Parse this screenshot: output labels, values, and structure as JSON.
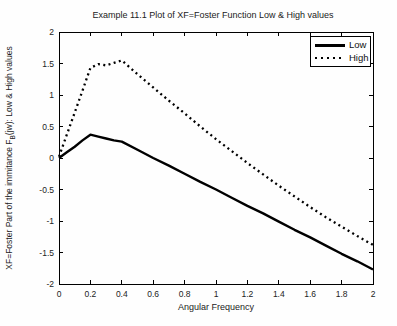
{
  "figure": {
    "background": "#fefefe",
    "line_color": "#000000"
  },
  "chart_data": {
    "type": "line",
    "title": "Example 11.1 Plot of XF=Foster Function Low & High values",
    "xlabel": "Angular Frequency",
    "ylabel": "XF=Foster Part of the immitance F_B(jw): Low & High values",
    "ylabel_prefix": "XF=Foster Part of the immitance F",
    "ylabel_sub": "B",
    "ylabel_suffix": "(jw): Low & High values",
    "xlim": [
      0,
      2
    ],
    "ylim": [
      -2,
      2
    ],
    "grid": false,
    "x_ticks": [
      0,
      0.2,
      0.4,
      0.6,
      0.8,
      1,
      1.2,
      1.4,
      1.6,
      1.8,
      2
    ],
    "x_tick_labels": [
      "0",
      "0.2",
      "0.4",
      "0.6",
      "0.8",
      "1",
      "1.2",
      "1.4",
      "1.6",
      "1.8",
      "2"
    ],
    "y_ticks": [
      2,
      1.5,
      1,
      0.5,
      0,
      -0.5,
      -1,
      -1.5,
      -2
    ],
    "y_tick_labels": [
      "2",
      "1.5",
      "1",
      "0.5",
      "0",
      "-0.5",
      "-1",
      "-1.5",
      "-2"
    ],
    "legend": {
      "position": "top-right"
    },
    "x": [
      0,
      0.05,
      0.1,
      0.15,
      0.2,
      0.25,
      0.3,
      0.35,
      0.4,
      0.5,
      0.6,
      0.7,
      0.8,
      0.9,
      1.0,
      1.1,
      1.2,
      1.3,
      1.4,
      1.5,
      1.6,
      1.7,
      1.8,
      1.9,
      2.0
    ],
    "series": [
      {
        "name": "Low",
        "style": "solid",
        "color": "#000000",
        "values": [
          0,
          0.09,
          0.18,
          0.28,
          0.37,
          0.34,
          0.31,
          0.28,
          0.26,
          0.13,
          0.0,
          -0.12,
          -0.25,
          -0.38,
          -0.5,
          -0.63,
          -0.76,
          -0.88,
          -1.01,
          -1.14,
          -1.26,
          -1.39,
          -1.52,
          -1.64,
          -1.77
        ]
      },
      {
        "name": "High",
        "style": "dotted",
        "color": "#000000",
        "values": [
          0.02,
          0.37,
          0.72,
          1.07,
          1.43,
          1.49,
          1.47,
          1.51,
          1.55,
          1.33,
          1.12,
          0.91,
          0.71,
          0.5,
          0.3,
          0.11,
          -0.08,
          -0.26,
          -0.44,
          -0.61,
          -0.78,
          -0.94,
          -1.09,
          -1.24,
          -1.38
        ]
      }
    ]
  }
}
